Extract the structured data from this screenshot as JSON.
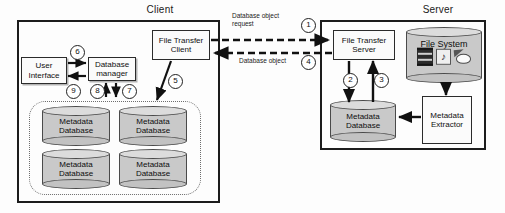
{
  "diagram": {
    "zones": [
      {
        "id": "client",
        "label": "Client"
      },
      {
        "id": "server",
        "label": "Server"
      }
    ],
    "client": {
      "nodes": {
        "user_interface": "User\nInterface",
        "user_interface_line1": "User",
        "user_interface_line2": "Interface",
        "database_manager_line1": "Database",
        "database_manager_line2": "manager",
        "file_transfer_client_line1": "File Transfer",
        "file_transfer_client_line2": "Client"
      },
      "databases": [
        {
          "line1": "Metadata",
          "line2": "Database"
        },
        {
          "line1": "Metadata",
          "line2": "Database"
        },
        {
          "line1": "Metadata",
          "line2": "Database"
        },
        {
          "line1": "Metadata",
          "line2": "Database"
        }
      ]
    },
    "server": {
      "nodes": {
        "file_transfer_server_line1": "File Transfer",
        "file_transfer_server_line2": "Server",
        "metadata_database_line1": "Metadata",
        "metadata_database_line2": "Database",
        "metadata_extractor_line1": "Metadata",
        "metadata_extractor_line2": "Extractor",
        "file_system": "File System"
      },
      "file_system_icons": [
        "film-icon",
        "music-note-icon",
        "picture-icon"
      ]
    },
    "edge_labels": {
      "request_line1": "Database object",
      "request_line2": "request",
      "response": "Database object"
    },
    "step_numbers": {
      "n1": "1",
      "n2": "2",
      "n3": "3",
      "n4": "4",
      "n5": "5",
      "n6": "6",
      "n7": "7",
      "n8": "8",
      "n9": "9"
    },
    "colors": {
      "stroke": "#1c1c1c",
      "cylinder_fill": "#c9c9c9",
      "cylinder_top": "#dcdcdc",
      "background": "#fdfdfd"
    }
  }
}
